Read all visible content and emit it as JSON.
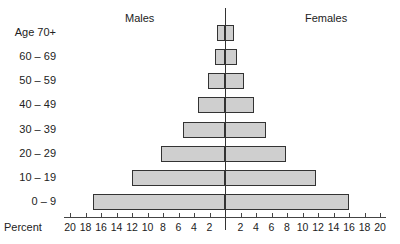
{
  "chart_data": {
    "type": "bar",
    "subtype": "population-pyramid",
    "title": "",
    "xlabel": "Percent",
    "ylabel": "",
    "categories": [
      "Age 70+",
      "60 – 69",
      "50 – 59",
      "40 – 49",
      "30 – 39",
      "20 – 29",
      "10 – 19",
      "0 – 9"
    ],
    "series": [
      {
        "name": "Males",
        "side": "left",
        "values": [
          1.0,
          1.3,
          2.2,
          3.5,
          5.4,
          8.2,
          12.0,
          17.0
        ]
      },
      {
        "name": "Females",
        "side": "right",
        "values": [
          1.1,
          1.5,
          2.4,
          3.7,
          5.3,
          7.9,
          11.7,
          16.0
        ]
      }
    ],
    "xlim": [
      -20,
      20
    ],
    "x_tick_labels_left": [
      "20",
      "18",
      "16",
      "14",
      "12",
      "10",
      "8",
      "6",
      "4",
      "2"
    ],
    "x_tick_labels_right": [
      "2",
      "4",
      "6",
      "8",
      "10",
      "12",
      "14",
      "16",
      "18",
      "20"
    ],
    "grid": false,
    "legend": "side headers 'Males' (left) and 'Females' (right)"
  },
  "headers": {
    "males": "Males",
    "females": "Females"
  },
  "axis": {
    "label": "Percent"
  },
  "ages": [
    "Age 70+",
    "60 – 69",
    "50 – 59",
    "40 – 49",
    "30 – 39",
    "20 – 29",
    "10 – 19",
    "0 – 9"
  ]
}
